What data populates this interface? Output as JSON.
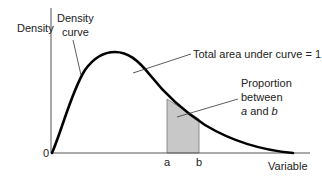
{
  "diagram": {
    "type": "density-curve",
    "y_axis_label": "Density",
    "x_axis_label": "Variable",
    "origin_label": "0",
    "curve_label_line1": "Density",
    "curve_label_line2": "curve",
    "total_area_label": "Total area under curve = 1",
    "proportion_line1": "Proportion",
    "proportion_line2": "between",
    "proportion_line3_a": "a",
    "proportion_line3_and": " and ",
    "proportion_line3_b": "b",
    "tick_a": "a",
    "tick_b": "b",
    "colors": {
      "curve": "#000000",
      "axes": "#555555",
      "shade": "#c8c8c8",
      "text": "#222222"
    }
  }
}
